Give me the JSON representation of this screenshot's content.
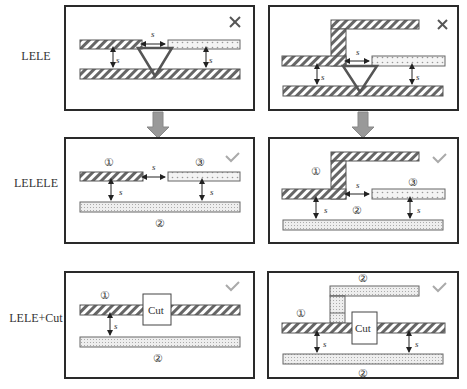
{
  "rows": [
    {
      "label": "LELE",
      "top": 56
    },
    {
      "label": "LELELE",
      "top": 183
    },
    {
      "label": "LELE+Cut",
      "top": 318
    }
  ],
  "annotations": {
    "spacing": "s",
    "cut_label": "Cut",
    "mask1": "①",
    "mask2": "②",
    "mask3": "③",
    "fail_mark": "×",
    "pass_mark": "✓"
  },
  "panels": [
    {
      "id": "lele-straight",
      "result": "fail"
    },
    {
      "id": "lele-bend",
      "result": "fail"
    },
    {
      "id": "lelele-straight",
      "result": "pass"
    },
    {
      "id": "lelele-bend",
      "result": "pass"
    },
    {
      "id": "lele-cut-straight",
      "result": "pass"
    },
    {
      "id": "lele-cut-bend",
      "result": "pass"
    }
  ],
  "colors": {
    "frame": "#2a2a2a",
    "hatch": "#555555",
    "conflict_triangle": "#555555",
    "check": "#aaaaaa",
    "arrow_fill": "#999999"
  }
}
